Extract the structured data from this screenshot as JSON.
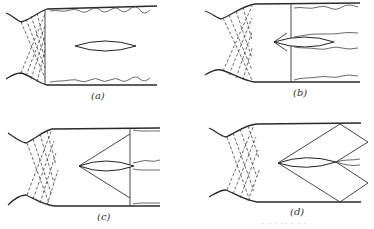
{
  "figure": {
    "panels": [
      {
        "id": "a",
        "label": "(a)",
        "feature": "airfoil in channel, no shock attached"
      },
      {
        "id": "b",
        "label": "(b)",
        "feature": "normal shock across channel near airfoil leading region, detached bow wave"
      },
      {
        "id": "c",
        "label": "(c)",
        "feature": "oblique shocks from leading edge meeting normal shock at trailing edge"
      },
      {
        "id": "d",
        "label": "(d)",
        "feature": "oblique shocks reflecting off walls forming diamond pattern"
      }
    ],
    "caption_fragment": "· · ·  ·· ·  · ·"
  },
  "colors": {
    "ink": "#2a2a2a",
    "background": "#ffffff"
  }
}
